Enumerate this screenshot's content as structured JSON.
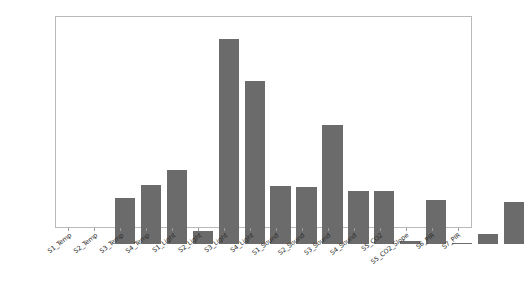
{
  "chart_data": {
    "type": "bar",
    "title": "",
    "xlabel": "",
    "ylabel": "",
    "ylim": [
      0.0,
      0.21
    ],
    "grid": false,
    "legend": "none",
    "bar_color": "#6b6b6b",
    "yticks": [
      "0.000",
      "0.025",
      "0.050",
      "0.075",
      "0.100",
      "0.125",
      "0.150",
      "0.175",
      "0.200"
    ],
    "ytick_values": [
      0.0,
      0.025,
      0.05,
      0.075,
      0.1,
      0.125,
      0.15,
      0.175,
      0.2
    ],
    "categories": [
      "S1_Temp",
      "S2_Temp",
      "S3_Temp",
      "S4_Temp",
      "S1_Light",
      "S2_Light",
      "S3_Light",
      "S4_Light",
      "S1_Sound",
      "S2_Sound",
      "S3_Sound",
      "S4_Sound",
      "S5_CO2",
      "S5_CO2_Slope",
      "S6_PIR",
      "S7_PIR"
    ],
    "values": [
      0.046,
      0.059,
      0.074,
      0.013,
      0.205,
      0.163,
      0.058,
      0.057,
      0.119,
      0.053,
      0.053,
      0.003,
      0.044,
      0.001,
      0.01,
      0.042
    ]
  }
}
